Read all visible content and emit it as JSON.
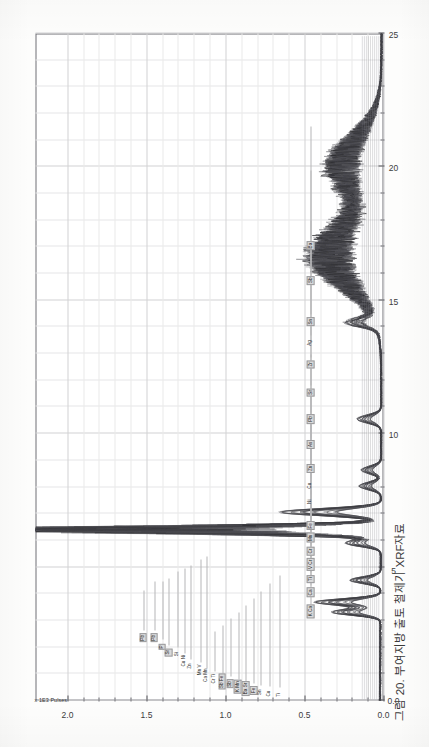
{
  "figure": {
    "title": "CHILGI  XRF Spectrum NO 001~048",
    "caption": "그림 20. 부여지방 출토 철제기 XRF자료",
    "intensity_unit": "x 1E3 Pulses"
  },
  "chart_data": {
    "type": "line",
    "title": "CHILGI  XRF Spectrum NO 001~048",
    "subtitle": "",
    "orientation": "rotated-90ccw (energy axis vertical on page, intensity axis horizontal on page)",
    "xlabel": "Energy (keV)",
    "ylabel": "x 1E3 Pulses",
    "xlim": [
      0,
      25
    ],
    "ylim": [
      0.0,
      2.2
    ],
    "grid": true,
    "legend_position": "none",
    "series_count": 48,
    "energy_ticks_major": [
      "0.0",
      "5",
      "10",
      "15",
      "20",
      "25"
    ],
    "energy_ticks_major_values": [
      0,
      5,
      10,
      15,
      20,
      25
    ],
    "energy_tick_minor_step": 1,
    "intensity_ticks_major": [
      "0.0",
      "0.5",
      "1.0",
      "1.5",
      "2.0"
    ],
    "intensity_ticks_major_values": [
      0.0,
      0.5,
      1.0,
      1.5,
      2.0
    ],
    "intensity_tick_minor_step": 0.1,
    "element_labels": [
      {
        "text": "Pb",
        "energy": 2.35,
        "intensity": 1.52,
        "boxed": true
      },
      {
        "text": "Pb",
        "energy": 2.35,
        "intensity": 1.45,
        "boxed": true
      },
      {
        "text": "P",
        "energy": 2.01,
        "intensity": 1.4,
        "boxed": true
      },
      {
        "text": "Sr",
        "energy": 1.81,
        "intensity": 1.36,
        "boxed": true
      },
      {
        "text": "Si",
        "energy": 1.74,
        "intensity": 1.3,
        "boxed": false
      },
      {
        "text": "Cu Ni",
        "energy": 1.49,
        "intensity": 1.26,
        "boxed": false
      },
      {
        "text": "Zn",
        "energy": 1.29,
        "intensity": 1.22,
        "boxed": false
      },
      {
        "text": "Mn V",
        "energy": 1.15,
        "intensity": 1.16,
        "boxed": false
      },
      {
        "text": "Ca Mn",
        "energy": 0.95,
        "intensity": 1.12,
        "boxed": false
      },
      {
        "text": "Cr Ti",
        "energy": 0.82,
        "intensity": 1.07,
        "boxed": false
      },
      {
        "text": "Sb Fe",
        "energy": 0.7,
        "intensity": 1.02,
        "boxed": true
      },
      {
        "text": "Sb",
        "energy": 0.62,
        "intensity": 0.97,
        "boxed": true
      },
      {
        "text": "K  Mn",
        "energy": 0.52,
        "intensity": 0.92,
        "boxed": true
      },
      {
        "text": "Ba Sr",
        "energy": 0.45,
        "intensity": 0.87,
        "boxed": true
      },
      {
        "text": "Fe",
        "energy": 0.38,
        "intensity": 0.82,
        "boxed": true
      },
      {
        "text": "Sn",
        "energy": 0.31,
        "intensity": 0.78,
        "boxed": false
      },
      {
        "text": "Cu",
        "energy": 0.26,
        "intensity": 0.72,
        "boxed": false
      },
      {
        "text": "Ti",
        "energy": 0.21,
        "intensity": 0.66,
        "boxed": false
      },
      {
        "text": "K Ca",
        "energy": 3.35,
        "intensity": 0.46,
        "boxed": true
      },
      {
        "text": "Ca",
        "energy": 4.05,
        "intensity": 0.46,
        "boxed": true
      },
      {
        "text": "Ti",
        "energy": 4.55,
        "intensity": 0.46,
        "boxed": true
      },
      {
        "text": "V  Cr",
        "energy": 5.1,
        "intensity": 0.46,
        "boxed": true
      },
      {
        "text": "Cr",
        "energy": 5.6,
        "intensity": 0.46,
        "boxed": true
      },
      {
        "text": "Mn",
        "energy": 6.1,
        "intensity": 0.46,
        "boxed": true
      },
      {
        "text": "Fe",
        "energy": 6.55,
        "intensity": 0.46,
        "boxed": true
      },
      {
        "text": "Ni",
        "energy": 7.45,
        "intensity": 0.46,
        "boxed": false
      },
      {
        "text": "Cu",
        "energy": 8.05,
        "intensity": 0.46,
        "boxed": false
      },
      {
        "text": "Zn",
        "energy": 8.7,
        "intensity": 0.46,
        "boxed": true
      },
      {
        "text": "As",
        "energy": 9.6,
        "intensity": 0.46,
        "boxed": true
      },
      {
        "text": "Pb",
        "energy": 10.55,
        "intensity": 0.46,
        "boxed": true
      },
      {
        "text": "Sr",
        "energy": 11.55,
        "intensity": 0.46,
        "boxed": true
      },
      {
        "text": "Zr",
        "energy": 12.6,
        "intensity": 0.46,
        "boxed": true
      },
      {
        "text": "Ag",
        "energy": 13.4,
        "intensity": 0.46,
        "boxed": false
      },
      {
        "text": "Sn",
        "energy": 14.2,
        "intensity": 0.46,
        "boxed": true
      },
      {
        "text": "Sb",
        "energy": 15.75,
        "intensity": 0.46,
        "boxed": true
      },
      {
        "text": "Ba",
        "energy": 17.05,
        "intensity": 0.46,
        "boxed": true
      }
    ],
    "peaks": [
      {
        "element": "Fe Ka",
        "energy": 6.4,
        "intensity": 2.1
      },
      {
        "element": "Fe Kb",
        "energy": 7.06,
        "intensity": 0.46
      },
      {
        "element": "Ca",
        "energy": 3.69,
        "intensity": 0.3
      },
      {
        "element": "K",
        "energy": 3.31,
        "intensity": 0.22
      },
      {
        "element": "Ti",
        "energy": 4.51,
        "intensity": 0.14
      },
      {
        "element": "Mn",
        "energy": 5.9,
        "intensity": 0.16
      },
      {
        "element": "Cu",
        "energy": 8.04,
        "intensity": 0.1
      },
      {
        "element": "Zn",
        "energy": 8.64,
        "intensity": 0.09
      },
      {
        "element": "Pb La",
        "energy": 10.55,
        "intensity": 0.11
      },
      {
        "element": "Sr",
        "energy": 14.16,
        "intensity": 0.13
      },
      {
        "element": "Compton/scatter",
        "energy": 16.6,
        "intensity": 0.25
      },
      {
        "element": "Rh Ka scatter",
        "energy": 20.2,
        "intensity": 0.18
      },
      {
        "element": "baseline",
        "energy": 24.8,
        "intensity": 0.02
      }
    ]
  }
}
